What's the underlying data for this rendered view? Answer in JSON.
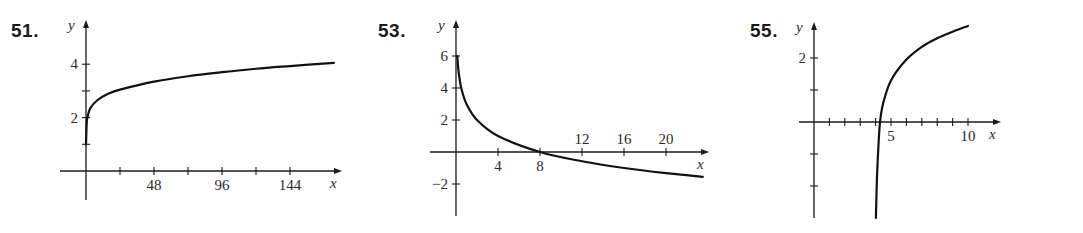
{
  "chart_data": [
    {
      "type": "line",
      "label": "51.",
      "title": "",
      "xlabel": "x",
      "ylabel": "y",
      "xlim": [
        0,
        175
      ],
      "ylim": [
        -1,
        4.5
      ],
      "x_ticks": [
        24,
        48,
        72,
        96,
        120,
        144
      ],
      "x_tick_labels": [
        "",
        "48",
        "",
        "96",
        "",
        "144"
      ],
      "y_ticks": [
        1,
        2,
        3,
        4
      ],
      "y_tick_labels": [
        "",
        "2",
        "",
        "4"
      ],
      "grid": false,
      "series": [
        {
          "name": "curve",
          "x": [
            0,
            0.5,
            1,
            3,
            8,
            16,
            24,
            48,
            72,
            96,
            120,
            144,
            175
          ],
          "y": [
            1.0,
            1.8,
            2.0,
            2.35,
            2.65,
            2.9,
            3.05,
            3.35,
            3.55,
            3.7,
            3.83,
            3.93,
            4.05
          ]
        }
      ]
    },
    {
      "type": "line",
      "label": "53.",
      "title": "",
      "xlabel": "x",
      "ylabel": "y",
      "xlim": [
        0,
        23.5
      ],
      "ylim": [
        -3.5,
        7
      ],
      "x_ticks": [
        4,
        8,
        12,
        16,
        20
      ],
      "x_tick_labels": [
        "4",
        "8",
        "12",
        "16",
        "20"
      ],
      "y_ticks": [
        -2,
        2,
        4,
        6
      ],
      "y_tick_labels": [
        "−2",
        "2",
        "4",
        "6"
      ],
      "grid": false,
      "series": [
        {
          "name": "curve",
          "x": [
            0.125,
            0.25,
            0.5,
            1,
            2,
            4,
            8,
            12,
            16,
            20,
            23.5
          ],
          "y": [
            6,
            5,
            4,
            3,
            2,
            1,
            0,
            -0.58,
            -1,
            -1.32,
            -1.55
          ]
        }
      ]
    },
    {
      "type": "line",
      "label": "55.",
      "title": "",
      "xlabel": "x",
      "ylabel": "y",
      "xlim": [
        -1,
        11
      ],
      "ylim": [
        -3,
        3
      ],
      "x_ticks": [
        1,
        2,
        3,
        4,
        5,
        6,
        7,
        8,
        9,
        10
      ],
      "x_tick_labels": [
        "",
        "",
        "",
        "",
        "5",
        "",
        "",
        "",
        "",
        "10"
      ],
      "y_ticks": [
        -2,
        -1,
        1,
        2
      ],
      "y_tick_labels": [
        "",
        "",
        "",
        "2"
      ],
      "grid": false,
      "series": [
        {
          "name": "curve",
          "x": [
            4.02,
            4.05,
            4.1,
            4.2,
            4.3,
            4.5,
            5,
            6,
            7,
            8,
            9,
            10
          ],
          "y": [
            -3,
            -2.4,
            -1.6,
            -0.6,
            0.05,
            0.6,
            1.3,
            1.95,
            2.35,
            2.62,
            2.82,
            3.0
          ]
        }
      ]
    }
  ]
}
